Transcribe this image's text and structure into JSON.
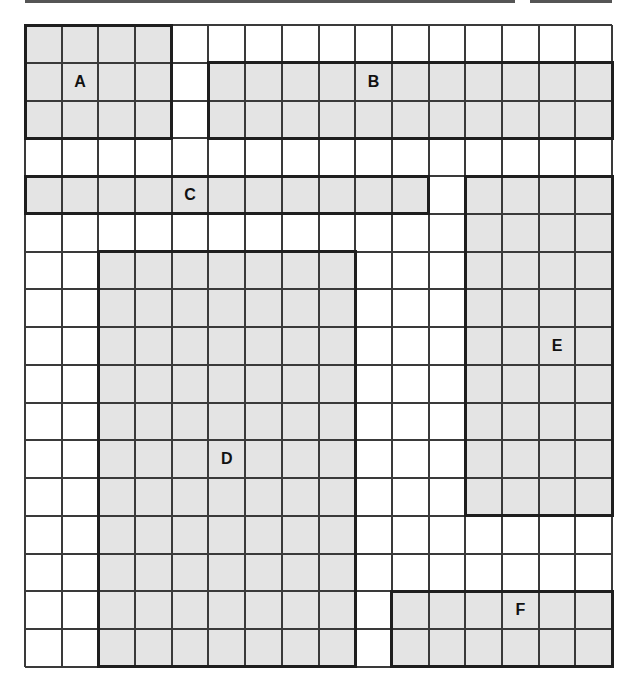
{
  "diagram": {
    "grid": {
      "columns": 16,
      "rows": 17,
      "left": 25,
      "top": 25,
      "width": 587,
      "height": 642,
      "line_color": "#3a3a3a",
      "fill_color": "#e4e4e4"
    },
    "regions": [
      {
        "id": "A",
        "label": "A",
        "col": 0,
        "row": 0,
        "cols": 4,
        "rows": 3,
        "label_col": 1.5,
        "label_row": 1.5
      },
      {
        "id": "B",
        "label": "B",
        "col": 5,
        "row": 1,
        "cols": 11,
        "rows": 2,
        "label_col": 9.5,
        "label_row": 1.5
      },
      {
        "id": "C",
        "label": "C",
        "col": 0,
        "row": 4,
        "cols": 11,
        "rows": 1,
        "label_col": 4.5,
        "label_row": 4.5
      },
      {
        "id": "D",
        "label": "D",
        "col": 2,
        "row": 6,
        "cols": 7,
        "rows": 11,
        "label_col": 5.5,
        "label_row": 11.5
      },
      {
        "id": "E",
        "label": "E",
        "col": 12,
        "row": 4,
        "cols": 4,
        "rows": 9,
        "label_col": 14.5,
        "label_row": 8.5
      },
      {
        "id": "F",
        "label": "F",
        "col": 10,
        "row": 15,
        "cols": 6,
        "rows": 2,
        "label_col": 13.5,
        "label_row": 15.5
      }
    ]
  }
}
